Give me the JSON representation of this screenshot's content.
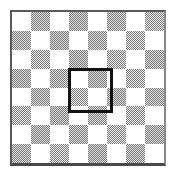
{
  "figure": {
    "name": "checkerboard-with-highlighted-2x2-block",
    "canvas": {
      "width": 176,
      "height": 176,
      "background": "#ffffff"
    },
    "frame": {
      "left": 10,
      "top": 10,
      "width": 156,
      "height": 156,
      "border_color": "#595959",
      "border_width_px": 2
    },
    "board": {
      "columns": 8,
      "rows": 8,
      "light_color": "#ffffff",
      "dark_color": "#7a7a7a",
      "dark_fill_style": "halftone-dither",
      "top_left_cell": "light",
      "pattern": [
        [
          "light",
          "dark",
          "light",
          "dark",
          "light",
          "dark",
          "light",
          "dark"
        ],
        [
          "dark",
          "light",
          "dark",
          "light",
          "dark",
          "light",
          "dark",
          "light"
        ],
        [
          "light",
          "dark",
          "light",
          "dark",
          "light",
          "dark",
          "light",
          "dark"
        ],
        [
          "dark",
          "light",
          "dark",
          "light",
          "dark",
          "light",
          "dark",
          "light"
        ],
        [
          "light",
          "dark",
          "light",
          "dark",
          "light",
          "dark",
          "light",
          "dark"
        ],
        [
          "dark",
          "light",
          "dark",
          "light",
          "dark",
          "light",
          "dark",
          "light"
        ],
        [
          "light",
          "dark",
          "light",
          "dark",
          "light",
          "dark",
          "light",
          "dark"
        ],
        [
          "dark",
          "light",
          "dark",
          "light",
          "dark",
          "light",
          "dark",
          "light"
        ]
      ],
      "tones": [
        [
          0,
          2,
          0,
          3,
          0,
          2,
          0,
          1
        ],
        [
          2,
          0,
          3,
          0,
          2,
          0,
          1,
          0
        ],
        [
          0,
          1,
          0,
          3,
          0,
          1,
          0,
          2
        ],
        [
          3,
          0,
          2,
          0,
          3,
          0,
          1,
          0
        ],
        [
          0,
          2,
          0,
          1,
          0,
          3,
          0,
          2
        ],
        [
          1,
          0,
          3,
          0,
          2,
          0,
          1,
          0
        ],
        [
          0,
          3,
          0,
          2,
          0,
          1,
          0,
          3
        ],
        [
          2,
          0,
          1,
          0,
          3,
          0,
          2,
          0
        ]
      ]
    },
    "highlight": {
      "label": "highlighted-2x2-block",
      "start_column": 3,
      "start_row": 3,
      "span_columns": 2,
      "span_rows": 2,
      "left": 56,
      "top": 56,
      "width": 45,
      "height": 45,
      "stroke_color": "#121212",
      "stroke_width_px": 3,
      "enclosed_cells": [
        "light",
        "dark",
        "dark",
        "light"
      ]
    }
  }
}
